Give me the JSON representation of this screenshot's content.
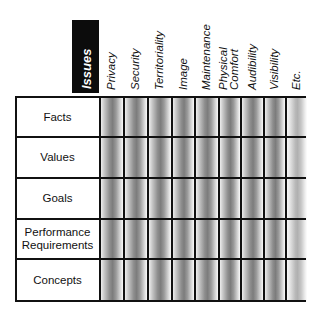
{
  "diagram": {
    "corner_header": "Issues",
    "columns": [
      {
        "label": "Privacy",
        "shade": "dark"
      },
      {
        "label": "Security",
        "shade": "dark"
      },
      {
        "label": "Territoriality",
        "shade": "dark"
      },
      {
        "label": "Image",
        "shade": "dark"
      },
      {
        "label": "Maintenance",
        "shade": "dark"
      },
      {
        "label": "Physical Comfort",
        "shade": "dark"
      },
      {
        "label": "Audibility",
        "shade": "dark"
      },
      {
        "label": "Visibility",
        "shade": "dark"
      },
      {
        "label": "Etc.",
        "shade": "light"
      }
    ],
    "rows": [
      {
        "label": "Facts"
      },
      {
        "label": "Values"
      },
      {
        "label": "Goals"
      },
      {
        "label": "Performance Requirements"
      },
      {
        "label": "Concepts"
      }
    ],
    "colors": {
      "header_block": "#0c0c0c",
      "header_text": "#ffffff",
      "grid_line": "#111111",
      "cell_shade_dark": "#7c7c7c",
      "cell_shade_light": "#b0b0b0"
    }
  }
}
